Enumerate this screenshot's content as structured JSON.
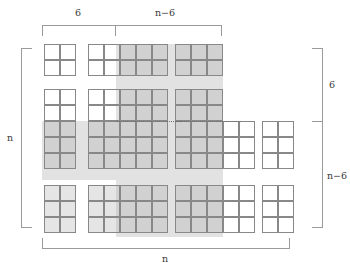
{
  "figure": {
    "labels": {
      "top_left": "6",
      "top_right": "n−6",
      "left": "n",
      "right_top": "6",
      "right_bottom": "n−6",
      "bottom": "n"
    },
    "colors": {
      "band": "#e2e2e2",
      "cell_border": "#888888",
      "cell_shade": "#aaaaaa",
      "bracket": "#9a9a9a",
      "text": "#3b3b3b",
      "background": "#ffffff"
    },
    "cell_size": 16,
    "blocks": [
      {
        "name": "block-r1-c1",
        "x": 44,
        "y": 44,
        "cols": 2,
        "rows": 2,
        "shaded_cols": 0,
        "shaded_rows": 0
      },
      {
        "name": "block-r1-c2",
        "x": 88,
        "y": 44,
        "cols": 5,
        "rows": 2,
        "shaded_from_col": 2,
        "shaded_rows": 2
      },
      {
        "name": "block-r1-c3",
        "x": 175,
        "y": 44,
        "cols": 3,
        "rows": 2,
        "shaded_from_col": 0,
        "shaded_rows": 2
      },
      {
        "name": "block-r2-c1",
        "x": 44,
        "y": 89,
        "cols": 2,
        "rows": 5,
        "shaded_from_row": 2,
        "shaded_from_col": 0
      },
      {
        "name": "block-r2-c2",
        "x": 88,
        "y": 89,
        "cols": 5,
        "rows": 5,
        "shaded_mixed": true
      },
      {
        "name": "block-r2-c3",
        "x": 175,
        "y": 89,
        "cols": 3,
        "rows": 5,
        "shaded_from_row": 0,
        "shaded_from_col": 0
      },
      {
        "name": "block-r2-c4",
        "x": 223,
        "y": 121,
        "cols": 2,
        "rows": 3,
        "shaded_cols": 0,
        "shaded_rows": 0
      },
      {
        "name": "block-r2-c5",
        "x": 262,
        "y": 121,
        "cols": 2,
        "rows": 3,
        "shaded_cols": 0,
        "shaded_rows": 0
      },
      {
        "name": "block-r3-c1",
        "x": 44,
        "y": 185,
        "cols": 2,
        "rows": 3,
        "shaded_from_col": 0,
        "shaded_from_row": 0
      },
      {
        "name": "block-r3-c2",
        "x": 88,
        "y": 185,
        "cols": 5,
        "rows": 3,
        "shaded_from_col": 0,
        "shaded_from_row": 0
      },
      {
        "name": "block-r3-c3",
        "x": 175,
        "y": 185,
        "cols": 5,
        "rows": 3,
        "shaded_until_col": 3
      },
      {
        "name": "block-r3-c5",
        "x": 262,
        "y": 185,
        "cols": 2,
        "rows": 3,
        "shaded_cols": 0,
        "shaded_rows": 0
      }
    ],
    "bands": [
      {
        "name": "vertical-band",
        "x": 116,
        "y": 44,
        "w": 107,
        "h": 193
      },
      {
        "name": "horizontal-band",
        "x": 42,
        "y": 121,
        "w": 181,
        "h": 59
      }
    ],
    "dotted_lines": [
      {
        "name": "dotted-line-left",
        "x": 116,
        "y": 121,
        "w": 66
      },
      {
        "name": "dotted-line-right",
        "x": 175,
        "y": 121,
        "w": 66
      }
    ],
    "brackets": [
      {
        "name": "bracket-top-left",
        "orient": "h",
        "x": 42,
        "y": 25,
        "len": 74
      },
      {
        "name": "bracket-top-right",
        "orient": "h",
        "x": 116,
        "y": 25,
        "len": 106
      },
      {
        "name": "bracket-left",
        "orient": "v",
        "x": 21,
        "y": 48,
        "len": 180
      },
      {
        "name": "bracket-right-top",
        "orient": "v",
        "x": 322,
        "y": 48,
        "len": 73
      },
      {
        "name": "bracket-right-bottom",
        "orient": "v",
        "x": 322,
        "y": 121,
        "len": 107
      },
      {
        "name": "bracket-bottom",
        "orient": "h",
        "x": 42,
        "y": 238,
        "len": 248
      }
    ]
  }
}
